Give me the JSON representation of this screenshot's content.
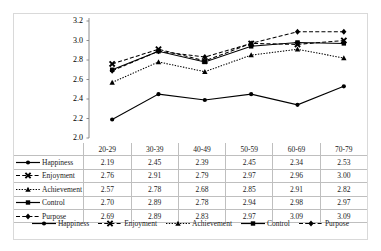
{
  "chart_data": {
    "type": "line",
    "title": "",
    "xlabel": "",
    "ylabel": "",
    "categories": [
      "20-29",
      "30-39",
      "40-49",
      "50-59",
      "60-69",
      "70-79"
    ],
    "ylim": [
      2.0,
      3.2
    ],
    "yticks": [
      "2.0",
      "2.2",
      "2.4",
      "2.6",
      "2.8",
      "3.0",
      "3.2"
    ],
    "ytick_step": 0.2,
    "grid": false,
    "legend_position": "bottom",
    "series": [
      {
        "name": "Happiness",
        "values": [
          2.19,
          2.45,
          2.39,
          2.45,
          2.34,
          2.53
        ],
        "marker": "circle",
        "line_style": "solid",
        "color": "#000000"
      },
      {
        "name": "Enjoyment",
        "values": [
          2.76,
          2.91,
          2.79,
          2.97,
          2.96,
          3.0
        ],
        "marker": "x",
        "line_style": "dashed",
        "color": "#000000"
      },
      {
        "name": "Achievement",
        "values": [
          2.57,
          2.78,
          2.68,
          2.85,
          2.91,
          2.82
        ],
        "marker": "triangle",
        "line_style": "dotted",
        "color": "#000000"
      },
      {
        "name": "Control",
        "values": [
          2.7,
          2.89,
          2.78,
          2.94,
          2.98,
          2.97
        ],
        "marker": "square",
        "line_style": "solid",
        "color": "#000000"
      },
      {
        "name": "Purpose",
        "values": [
          2.69,
          2.89,
          2.83,
          2.97,
          3.09,
          3.09
        ],
        "marker": "diamond",
        "line_style": "dashed",
        "color": "#000000"
      }
    ]
  },
  "table": {
    "header": [
      "",
      "20-29",
      "30-39",
      "40-49",
      "50-59",
      "60-69",
      "70-79"
    ],
    "rows": [
      {
        "label": "Happiness",
        "values": [
          "2.19",
          "2.45",
          "2.39",
          "2.45",
          "2.34",
          "2.53"
        ]
      },
      {
        "label": "Enjoyment",
        "values": [
          "2.76",
          "2.91",
          "2.79",
          "2.97",
          "2.96",
          "3.00"
        ]
      },
      {
        "label": "Achievement",
        "values": [
          "2.57",
          "2.78",
          "2.68",
          "2.85",
          "2.91",
          "2.82"
        ]
      },
      {
        "label": "Control",
        "values": [
          "2.70",
          "2.89",
          "2.78",
          "2.94",
          "2.98",
          "2.97"
        ]
      },
      {
        "label": "Purpose",
        "values": [
          "2.69",
          "2.89",
          "2.83",
          "2.97",
          "3.09",
          "3.09"
        ]
      }
    ]
  },
  "legend": {
    "items": [
      {
        "label": "Happiness"
      },
      {
        "label": "Enjoyment"
      },
      {
        "label": "Achievement"
      },
      {
        "label": "Control"
      },
      {
        "label": "Purpose"
      }
    ]
  },
  "style": {
    "border_color": "#d9d9d9",
    "grid_color": "#bfbfbf",
    "line_color": "#000000",
    "background": "#ffffff"
  }
}
